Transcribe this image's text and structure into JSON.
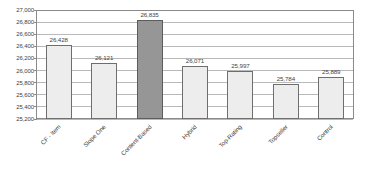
{
  "chart_data": {
    "type": "bar",
    "title": "",
    "subtitle": "",
    "xlabel": "",
    "ylabel": "",
    "categories": [
      "CF - Item",
      "Slope One",
      "Content-Based",
      "Hybrid",
      "Top-Rating",
      "Topseller",
      "Control"
    ],
    "values": [
      26428,
      26121,
      26835,
      26071,
      25997,
      25784,
      25889
    ],
    "value_labels": [
      "26,428",
      "26,121",
      "26,835",
      "26,071",
      "25,997",
      "25,784",
      "25,889"
    ],
    "ylim": [
      25200,
      27000
    ],
    "ytick_values": [
      27000,
      26800,
      26600,
      26400,
      26200,
      26000,
      25800,
      25600,
      25400,
      25200
    ],
    "ytick_labels": [
      "27,000",
      "26,800",
      "26,600",
      "26,400",
      "26,200",
      "26,000",
      "25,800",
      "25,600",
      "25,400",
      "25,200"
    ],
    "grid": true,
    "legend": "none",
    "highlight_index": 2,
    "colors": {
      "bar_fill": "#ededed",
      "bar_border": "#6e6e6e",
      "highlight_fill": "#969696",
      "highlight_border": "#5c5c5c",
      "gridline": "#b9b9b9",
      "axis": "#8a8a8a",
      "text": "#3f3f3f",
      "background": "#ffffff"
    }
  }
}
